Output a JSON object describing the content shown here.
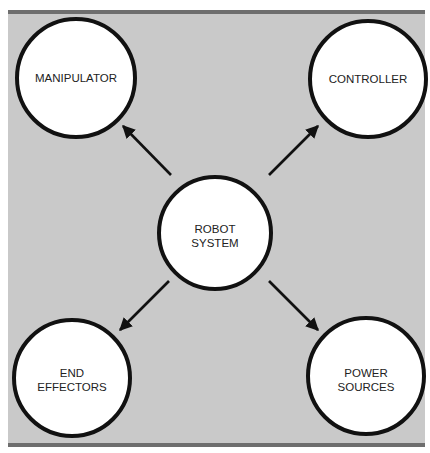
{
  "diagram": {
    "center": {
      "id": "robot-system",
      "label_lines": [
        "ROBOT",
        "SYSTEM"
      ]
    },
    "nodes": [
      {
        "id": "manipulator",
        "label_lines": [
          "MANIPULATOR"
        ]
      },
      {
        "id": "controller",
        "label_lines": [
          "CONTROLLER"
        ]
      },
      {
        "id": "end-effectors",
        "label_lines": [
          "END",
          "EFFECTORS"
        ]
      },
      {
        "id": "power-sources",
        "label_lines": [
          "POWER",
          "SOURCES"
        ]
      }
    ],
    "edges": [
      {
        "from": "robot-system",
        "to": "manipulator"
      },
      {
        "from": "robot-system",
        "to": "controller"
      },
      {
        "from": "robot-system",
        "to": "end-effectors"
      },
      {
        "from": "robot-system",
        "to": "power-sources"
      }
    ],
    "colors": {
      "background": "#c9c9c9",
      "border_bar": "#6e6e6e",
      "circle_fill": "#ffffff",
      "stroke": "#111111"
    }
  }
}
